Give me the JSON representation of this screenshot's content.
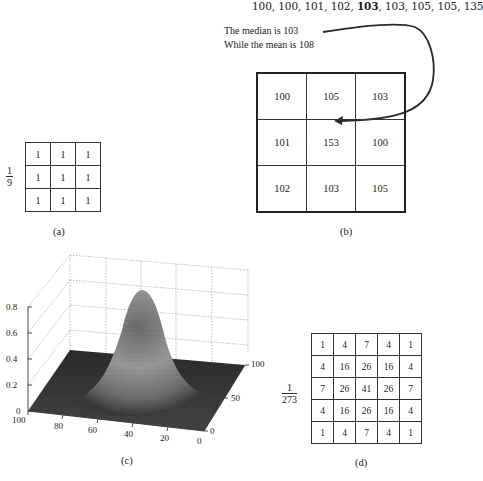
{
  "panel_b": {
    "sequence_parts": [
      "100, 100, 101, 102, ",
      "103",
      ", 103, 105, 105, 135"
    ],
    "note_line1": "The median is 103",
    "note_line2": "While the mean is 108",
    "grid": [
      [
        "100",
        "105",
        "103"
      ],
      [
        "101",
        "153",
        "100"
      ],
      [
        "102",
        "103",
        "105"
      ]
    ],
    "label": "(b)"
  },
  "panel_a": {
    "fraction_num": "1",
    "fraction_den": "9",
    "grid": [
      [
        "1",
        "1",
        "1"
      ],
      [
        "1",
        "1",
        "1"
      ],
      [
        "1",
        "1",
        "1"
      ]
    ],
    "label": "(a)"
  },
  "panel_c": {
    "label": "(c)",
    "z_ticks": [
      "0.8",
      "0.6",
      "0.4",
      "0.2",
      "0"
    ],
    "x_ticks": [
      "100",
      "80",
      "60",
      "40",
      "20",
      "0"
    ],
    "y_ticks": [
      "100",
      "50",
      "0"
    ],
    "surface": "2D Gaussian surface peaking near 0.85 at center (50,50)"
  },
  "panel_d": {
    "fraction_num": "1",
    "fraction_den": "273",
    "grid": [
      [
        "1",
        "4",
        "7",
        "4",
        "1"
      ],
      [
        "4",
        "16",
        "26",
        "16",
        "4"
      ],
      [
        "7",
        "26",
        "41",
        "26",
        "7"
      ],
      [
        "4",
        "16",
        "26",
        "16",
        "4"
      ],
      [
        "1",
        "4",
        "7",
        "4",
        "1"
      ]
    ],
    "label": "(d)"
  }
}
